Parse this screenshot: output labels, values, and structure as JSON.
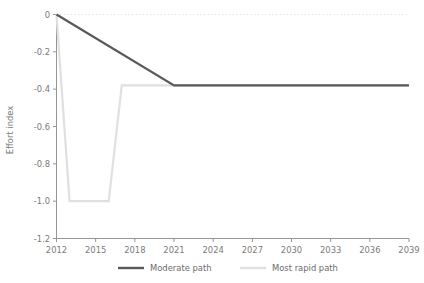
{
  "chart_data": {
    "type": "line",
    "title": "",
    "subtitle": "",
    "xlabel": "",
    "ylabel": "Effort index",
    "xlim": [
      2012,
      2039
    ],
    "ylim": [
      -1.2,
      0
    ],
    "grid": false,
    "legend_position": "bottom",
    "x_ticks": [
      "2012",
      "2015",
      "2018",
      "2021",
      "2024",
      "2027",
      "2030",
      "2033",
      "2036",
      "2039"
    ],
    "x_tick_values": [
      2012,
      2015,
      2018,
      2021,
      2024,
      2027,
      2030,
      2033,
      2036,
      2039
    ],
    "y_ticks": [
      "0",
      "-0.2",
      "-0.4",
      "-0.6",
      "-0.8",
      "-1.0",
      "-1.2"
    ],
    "y_tick_values": [
      0,
      -0.2,
      -0.4,
      -0.6,
      -0.8,
      -1.0,
      -1.2
    ],
    "reference_line": {
      "value": 0,
      "style": "dotted",
      "color": "#d8d8d8"
    },
    "series": [
      {
        "name": "Moderate path",
        "color": "#595959",
        "width": 2.2,
        "x": [
          2012,
          2021,
          2039
        ],
        "values": [
          0,
          -0.38,
          -0.38
        ]
      },
      {
        "name": "Most rapid path",
        "color": "#e0e0e0",
        "width": 2.2,
        "x": [
          2012,
          2013,
          2016,
          2017,
          2039
        ],
        "values": [
          0,
          -1.0,
          -1.0,
          -0.38,
          -0.38
        ]
      }
    ]
  },
  "legend": {
    "items": [
      {
        "label": "Moderate path",
        "color": "#595959"
      },
      {
        "label": "Most rapid path",
        "color": "#e0e0e0"
      }
    ]
  }
}
